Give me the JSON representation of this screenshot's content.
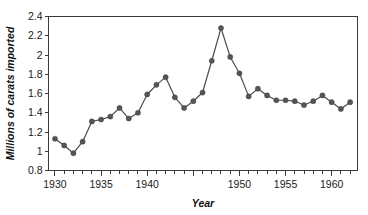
{
  "chart_data": {
    "type": "line",
    "title": "",
    "xlabel": "Year",
    "ylabel": "Millions of carats imported",
    "xlim": [
      1929.3,
      1962.8
    ],
    "ylim": [
      0.8,
      2.4
    ],
    "grid": false,
    "legend": null,
    "series_color": "#4c4c4c",
    "x_ticks_major": [
      1930,
      1935,
      1940,
      1945,
      1950,
      1955,
      1960
    ],
    "x_tick_labels": [
      "1930",
      "1935",
      "1940",
      "1945",
      "1950",
      "1955",
      "1960"
    ],
    "x_tick_labels_shown": [
      "1930",
      "1935",
      "1940",
      "",
      "1950",
      "1955",
      "1960"
    ],
    "x_minor_tick_step": 1,
    "y_ticks": [
      0.8,
      1.0,
      1.2,
      1.4,
      1.6,
      1.8,
      2.0,
      2.2,
      2.4
    ],
    "y_tick_labels": [
      "0.8",
      "1",
      "1.2",
      "1.4",
      "1.6",
      "1.8",
      "2",
      "2.2",
      "2.4"
    ],
    "x": [
      1930,
      1931,
      1932,
      1933,
      1934,
      1935,
      1936,
      1937,
      1938,
      1939,
      1940,
      1941,
      1942,
      1943,
      1944,
      1945,
      1946,
      1947,
      1948,
      1949,
      1950,
      1951,
      1952,
      1953,
      1954,
      1955,
      1956,
      1957,
      1958,
      1959,
      1960,
      1961,
      1962
    ],
    "values": [
      1.13,
      1.06,
      0.98,
      1.1,
      1.31,
      1.33,
      1.36,
      1.45,
      1.34,
      1.4,
      1.59,
      1.69,
      1.77,
      1.56,
      1.45,
      1.52,
      1.61,
      1.94,
      2.28,
      1.98,
      1.81,
      1.57,
      1.65,
      1.58,
      1.53,
      1.53,
      1.52,
      1.48,
      1.52,
      1.58,
      1.51,
      1.44,
      1.51
    ]
  },
  "figure": {
    "background_color": "#ffffff",
    "axis_color": "#3a3a3a"
  }
}
